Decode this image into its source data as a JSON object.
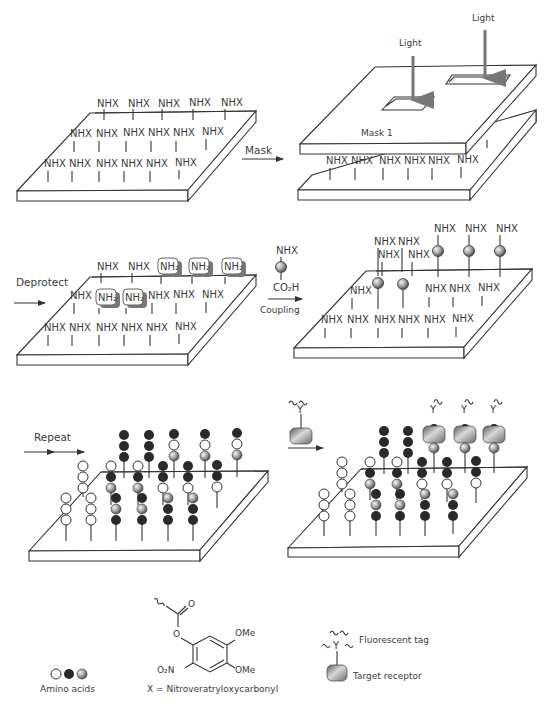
{
  "labels": {
    "mask_arrow": "Mask",
    "light_1": "Light",
    "light_2": "Light",
    "mask_name": "Mask 1",
    "deprotect": "Deprotect",
    "coupling": "Coupling",
    "reagent_top": "NHX",
    "reagent_bottom": "CO₂H",
    "repeat": "Repeat",
    "nhx": "NHX",
    "nh2": "NH₂"
  },
  "legend": {
    "amino_acids": "Amino acids",
    "x_definition": "X = Nitroveratryloxycarbonyl",
    "ome_1": "OMe",
    "ome_2": "OMe",
    "no2": "O₂N",
    "carbonyl_o": "O",
    "ester_o": "O",
    "fluorescent_tag": "Fluorescent tag",
    "target_receptor": "Target receptor"
  },
  "colors": {
    "line": "#333333",
    "arrow_gray": "#777777",
    "bead_dark": "#2a2a2a",
    "bead_gray": "#9a9a9a",
    "receptor_gray": "#8c8c8c"
  }
}
